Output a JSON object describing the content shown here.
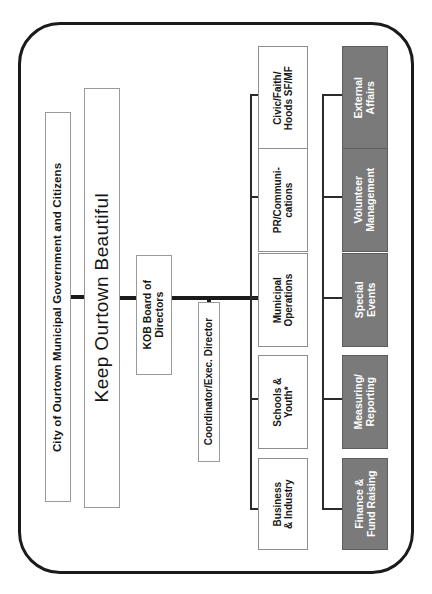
{
  "diagram": {
    "orientation": "rotated-90",
    "colors": {
      "frame_border": "#1a1a1a",
      "box_border": "#8a8a8a",
      "function_box_fill": "#7a7a7a",
      "function_box_text": "#ffffff",
      "committee_box_fill": "#ffffff",
      "connector": "#1a1a1a"
    },
    "levels": {
      "constituency": {
        "label": "City of Ourtown Municipal Government and Citizens"
      },
      "organization": {
        "label": "Keep Ourtown Beautiful"
      },
      "board": {
        "label": "KOB Board of\nDirectors"
      },
      "coordinator": {
        "label": "Coordinator/Exec. Director"
      }
    },
    "committees": {
      "heading": "Committees",
      "items": [
        {
          "label": "Civic/Faith/\nHoods SF/MF"
        },
        {
          "label": "PR/Communi-\ncations"
        },
        {
          "label": "Municipal\nOperations"
        },
        {
          "label": "Schools &\nYouth*"
        },
        {
          "label": "Business\n& Industry"
        }
      ]
    },
    "functions": {
      "heading": "Functional Areas",
      "items": [
        {
          "label": "External\nAffairs"
        },
        {
          "label": "Volunteer\nManagement"
        },
        {
          "label": "Special\nEvents"
        },
        {
          "label": "Measuring/\nReporting"
        },
        {
          "label": "Finance &\nFund Raising"
        }
      ]
    }
  }
}
